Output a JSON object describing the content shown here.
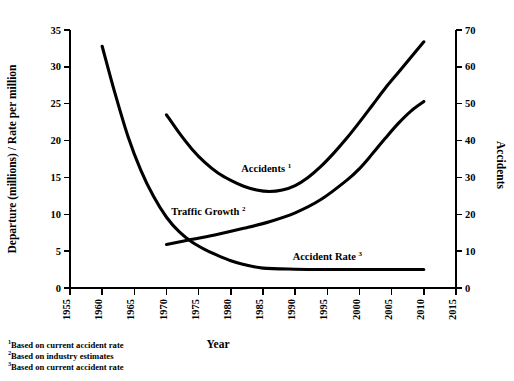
{
  "chart_data": {
    "type": "line",
    "title": "",
    "xlabel": "Year",
    "ylabel": "Departure (millions) / Rate per million",
    "y2label": "Accidents",
    "xlim": [
      1955,
      2015
    ],
    "ylim": [
      0,
      35
    ],
    "y2lim": [
      0,
      70
    ],
    "grid": false,
    "legend": "inline-annotations",
    "xticks": [
      1955,
      1960,
      1965,
      1970,
      1975,
      1980,
      1985,
      1990,
      1995,
      2000,
      2005,
      2010,
      2015
    ],
    "yticks": [
      0,
      5,
      10,
      15,
      20,
      25,
      30,
      35
    ],
    "y2ticks": [
      0,
      10,
      20,
      30,
      40,
      50,
      60,
      70
    ],
    "series": [
      {
        "name": "Accidents",
        "footnote_marker": "1",
        "axis": "right",
        "x": [
          1970,
          1972,
          1974,
          1976,
          1978,
          1980,
          1982,
          1984,
          1986,
          1988,
          1990,
          1992,
          1994,
          1996,
          1998,
          2000,
          2002,
          2004,
          2006,
          2008,
          2010
        ],
        "values": [
          47.0,
          42.0,
          37.6,
          34.0,
          31.2,
          29.2,
          27.6,
          26.6,
          26.2,
          26.6,
          27.8,
          30.0,
          33.0,
          36.6,
          40.6,
          45.0,
          49.6,
          54.2,
          58.4,
          62.6,
          66.8
        ],
        "values_left_scale": [
          23.5,
          21.0,
          18.8,
          17.0,
          15.6,
          14.6,
          13.8,
          13.3,
          13.1,
          13.3,
          13.9,
          15.0,
          16.5,
          18.3,
          20.3,
          22.5,
          24.8,
          27.1,
          29.2,
          31.3,
          33.4
        ]
      },
      {
        "name": "Traffic Growth",
        "footnote_marker": "2",
        "axis": "left",
        "x": [
          1970,
          1974,
          1978,
          1982,
          1986,
          1990,
          1994,
          1998,
          2000,
          2002,
          2004,
          2006,
          2008,
          2010
        ],
        "values": [
          5.9,
          6.6,
          7.3,
          8.1,
          9.0,
          10.2,
          12.0,
          14.6,
          16.2,
          18.2,
          20.3,
          22.3,
          24.0,
          25.3
        ]
      },
      {
        "name": "Accident Rate",
        "footnote_marker": "3",
        "axis": "left",
        "x": [
          1960,
          1962,
          1964,
          1966,
          1968,
          1970,
          1972,
          1974,
          1976,
          1978,
          1980,
          1982,
          1985,
          1990,
          1995,
          2000,
          2005,
          2010
        ],
        "values": [
          32.8,
          26.4,
          20.6,
          16.0,
          12.4,
          9.6,
          7.6,
          6.2,
          5.2,
          4.4,
          3.7,
          3.2,
          2.7,
          2.55,
          2.5,
          2.5,
          2.5,
          2.5
        ]
      }
    ],
    "annotations": [
      {
        "text": "Accidents",
        "marker": "1",
        "x": 1985.5,
        "y_px": 172
      },
      {
        "text": "Traffic Growth",
        "marker": "2",
        "x": 1976.5,
        "y_px": 215
      },
      {
        "text": "Accident Rate",
        "marker": "3",
        "x": 1995.0,
        "y_px": 260
      }
    ]
  },
  "footnotes": [
    {
      "marker": "1",
      "text": "Based on current accident rate"
    },
    {
      "marker": "2",
      "text": "Based on industry estimates"
    },
    {
      "marker": "3",
      "text": "Based on current accident rate"
    }
  ],
  "colors": {
    "line": "#000000",
    "axis": "#000000",
    "background": "#ffffff"
  }
}
